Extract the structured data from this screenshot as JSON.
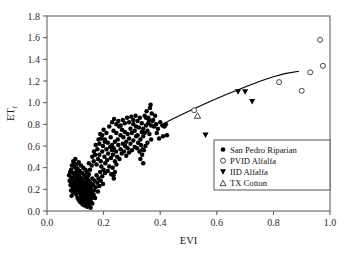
{
  "chart_data": {
    "type": "scatter",
    "title": "",
    "xlabel": "EVI",
    "ylabel": "ETf",
    "ylabel_base": "ET",
    "ylabel_sub": "f",
    "xlim": [
      0.0,
      1.0
    ],
    "ylim": [
      0.0,
      1.8
    ],
    "xticks": [
      "0.0",
      "0.2",
      "0.4",
      "0.6",
      "0.8",
      "1.0"
    ],
    "xtick_values": [
      0.0,
      0.2,
      0.4,
      0.6,
      0.8,
      1.0
    ],
    "yticks": [
      "0.0",
      "0.2",
      "0.4",
      "0.6",
      "0.8",
      "1.0",
      "1.2",
      "1.4",
      "1.6",
      "1.8"
    ],
    "ytick_values": [
      0.0,
      0.2,
      0.4,
      0.6,
      0.8,
      1.0,
      1.2,
      1.4,
      1.6,
      1.8
    ],
    "grid": false,
    "legend_position": "lower-right",
    "legend": [
      {
        "label": "San Pedro Riparian",
        "marker": "filled-circle"
      },
      {
        "label": "PVID Alfalfa",
        "marker": "open-circle"
      },
      {
        "label": "IID Alfalfa",
        "marker": "filled-triangle-down"
      },
      {
        "label": "TX Cotton",
        "marker": "open-triangle-up"
      }
    ],
    "series": [
      {
        "name": "San Pedro Riparian",
        "marker": "filled-circle",
        "points": [
          [
            0.085,
            0.38
          ],
          [
            0.088,
            0.42
          ],
          [
            0.09,
            0.3
          ],
          [
            0.092,
            0.35
          ],
          [
            0.094,
            0.25
          ],
          [
            0.095,
            0.44
          ],
          [
            0.096,
            0.2
          ],
          [
            0.098,
            0.33
          ],
          [
            0.099,
            0.28
          ],
          [
            0.1,
            0.4
          ],
          [
            0.101,
            0.18
          ],
          [
            0.102,
            0.24
          ],
          [
            0.103,
            0.36
          ],
          [
            0.104,
            0.15
          ],
          [
            0.105,
            0.31
          ],
          [
            0.106,
            0.22
          ],
          [
            0.107,
            0.27
          ],
          [
            0.108,
            0.12
          ],
          [
            0.109,
            0.34
          ],
          [
            0.11,
            0.19
          ],
          [
            0.111,
            0.26
          ],
          [
            0.112,
            0.29
          ],
          [
            0.113,
            0.1
          ],
          [
            0.114,
            0.23
          ],
          [
            0.115,
            0.32
          ],
          [
            0.116,
            0.17
          ],
          [
            0.117,
            0.21
          ],
          [
            0.118,
            0.08
          ],
          [
            0.119,
            0.25
          ],
          [
            0.12,
            0.14
          ],
          [
            0.121,
            0.3
          ],
          [
            0.122,
            0.11
          ],
          [
            0.123,
            0.2
          ],
          [
            0.124,
            0.27
          ],
          [
            0.125,
            0.16
          ],
          [
            0.126,
            0.06
          ],
          [
            0.127,
            0.23
          ],
          [
            0.128,
            0.13
          ],
          [
            0.129,
            0.28
          ],
          [
            0.13,
            0.09
          ],
          [
            0.131,
            0.18
          ],
          [
            0.132,
            0.24
          ],
          [
            0.133,
            0.05
          ],
          [
            0.134,
            0.15
          ],
          [
            0.135,
            0.21
          ],
          [
            0.136,
            0.31
          ],
          [
            0.137,
            0.11
          ],
          [
            0.138,
            0.26
          ],
          [
            0.139,
            0.07
          ],
          [
            0.14,
            0.17
          ],
          [
            0.141,
            0.22
          ],
          [
            0.142,
            0.04
          ],
          [
            0.143,
            0.13
          ],
          [
            0.144,
            0.29
          ],
          [
            0.145,
            0.19
          ],
          [
            0.146,
            0.09
          ],
          [
            0.147,
            0.24
          ],
          [
            0.148,
            0.14
          ],
          [
            0.149,
            0.06
          ],
          [
            0.15,
            0.2
          ],
          [
            0.151,
            0.27
          ],
          [
            0.152,
            0.11
          ],
          [
            0.153,
            0.16
          ],
          [
            0.154,
            0.03
          ],
          [
            0.155,
            0.22
          ],
          [
            0.156,
            0.08
          ],
          [
            0.157,
            0.18
          ],
          [
            0.158,
            0.25
          ],
          [
            0.159,
            0.12
          ],
          [
            0.16,
            0.3
          ],
          [
            0.093,
            0.46
          ],
          [
            0.097,
            0.41
          ],
          [
            0.1,
            0.48
          ],
          [
            0.104,
            0.43
          ],
          [
            0.108,
            0.39
          ],
          [
            0.112,
            0.45
          ],
          [
            0.116,
            0.37
          ],
          [
            0.12,
            0.42
          ],
          [
            0.124,
            0.35
          ],
          [
            0.128,
            0.4
          ],
          [
            0.132,
            0.33
          ],
          [
            0.136,
            0.38
          ],
          [
            0.14,
            0.36
          ],
          [
            0.144,
            0.32
          ],
          [
            0.148,
            0.34
          ],
          [
            0.082,
            0.36
          ],
          [
            0.086,
            0.31
          ],
          [
            0.089,
            0.26
          ],
          [
            0.091,
            0.22
          ],
          [
            0.093,
            0.17
          ],
          [
            0.078,
            0.33
          ],
          [
            0.08,
            0.28
          ],
          [
            0.083,
            0.24
          ],
          [
            0.085,
            0.19
          ],
          [
            0.087,
            0.14
          ],
          [
            0.145,
            0.05
          ],
          [
            0.15,
            0.09
          ],
          [
            0.155,
            0.13
          ],
          [
            0.16,
            0.07
          ],
          [
            0.165,
            0.15
          ],
          [
            0.163,
            0.24
          ],
          [
            0.166,
            0.19
          ],
          [
            0.168,
            0.28
          ],
          [
            0.17,
            0.12
          ],
          [
            0.172,
            0.22
          ],
          [
            0.175,
            0.33
          ],
          [
            0.178,
            0.26
          ],
          [
            0.18,
            0.18
          ],
          [
            0.182,
            0.3
          ],
          [
            0.185,
            0.23
          ],
          [
            0.188,
            0.36
          ],
          [
            0.19,
            0.28
          ],
          [
            0.192,
            0.41
          ],
          [
            0.195,
            0.32
          ],
          [
            0.198,
            0.25
          ],
          [
            0.175,
            0.43
          ],
          [
            0.18,
            0.48
          ],
          [
            0.185,
            0.52
          ],
          [
            0.19,
            0.46
          ],
          [
            0.195,
            0.55
          ],
          [
            0.2,
            0.38
          ],
          [
            0.203,
            0.5
          ],
          [
            0.206,
            0.44
          ],
          [
            0.21,
            0.57
          ],
          [
            0.213,
            0.47
          ],
          [
            0.216,
            0.53
          ],
          [
            0.22,
            0.41
          ],
          [
            0.223,
            0.59
          ],
          [
            0.226,
            0.49
          ],
          [
            0.23,
            0.56
          ],
          [
            0.195,
            0.7
          ],
          [
            0.2,
            0.75
          ],
          [
            0.205,
            0.66
          ],
          [
            0.21,
            0.72
          ],
          [
            0.215,
            0.63
          ],
          [
            0.22,
            0.78
          ],
          [
            0.225,
            0.68
          ],
          [
            0.23,
            0.61
          ],
          [
            0.235,
            0.74
          ],
          [
            0.24,
            0.64
          ],
          [
            0.233,
            0.52
          ],
          [
            0.236,
            0.58
          ],
          [
            0.24,
            0.46
          ],
          [
            0.244,
            0.55
          ],
          [
            0.248,
            0.5
          ],
          [
            0.252,
            0.61
          ],
          [
            0.256,
            0.48
          ],
          [
            0.26,
            0.57
          ],
          [
            0.264,
            0.53
          ],
          [
            0.268,
            0.62
          ],
          [
            0.228,
            0.34
          ],
          [
            0.232,
            0.4
          ],
          [
            0.236,
            0.3
          ],
          [
            0.24,
            0.36
          ],
          [
            0.245,
            0.43
          ],
          [
            0.245,
            0.72
          ],
          [
            0.25,
            0.66
          ],
          [
            0.255,
            0.78
          ],
          [
            0.26,
            0.7
          ],
          [
            0.265,
            0.75
          ],
          [
            0.27,
            0.68
          ],
          [
            0.275,
            0.73
          ],
          [
            0.28,
            0.64
          ],
          [
            0.285,
            0.71
          ],
          [
            0.29,
            0.67
          ],
          [
            0.272,
            0.55
          ],
          [
            0.276,
            0.6
          ],
          [
            0.28,
            0.51
          ],
          [
            0.285,
            0.58
          ],
          [
            0.29,
            0.54
          ],
          [
            0.295,
            0.62
          ],
          [
            0.3,
            0.56
          ],
          [
            0.305,
            0.65
          ],
          [
            0.31,
            0.59
          ],
          [
            0.315,
            0.69
          ],
          [
            0.295,
            0.76
          ],
          [
            0.3,
            0.72
          ],
          [
            0.305,
            0.8
          ],
          [
            0.31,
            0.74
          ],
          [
            0.315,
            0.78
          ],
          [
            0.32,
            0.7
          ],
          [
            0.325,
            0.77
          ],
          [
            0.33,
            0.66
          ],
          [
            0.335,
            0.73
          ],
          [
            0.34,
            0.69
          ],
          [
            0.318,
            0.58
          ],
          [
            0.322,
            0.63
          ],
          [
            0.327,
            0.55
          ],
          [
            0.332,
            0.61
          ],
          [
            0.338,
            0.57
          ],
          [
            0.23,
            0.82
          ],
          [
            0.237,
            0.85
          ],
          [
            0.245,
            0.8
          ],
          [
            0.252,
            0.83
          ],
          [
            0.26,
            0.79
          ],
          [
            0.268,
            0.84
          ],
          [
            0.275,
            0.81
          ],
          [
            0.283,
            0.86
          ],
          [
            0.29,
            0.82
          ],
          [
            0.298,
            0.87
          ],
          [
            0.305,
            0.84
          ],
          [
            0.313,
            0.88
          ],
          [
            0.32,
            0.83
          ],
          [
            0.328,
            0.86
          ],
          [
            0.335,
            0.81
          ],
          [
            0.34,
            0.76
          ],
          [
            0.345,
            0.72
          ],
          [
            0.35,
            0.79
          ],
          [
            0.355,
            0.74
          ],
          [
            0.36,
            0.84
          ],
          [
            0.345,
            0.88
          ],
          [
            0.352,
            0.92
          ],
          [
            0.358,
            0.86
          ],
          [
            0.364,
            0.95
          ],
          [
            0.37,
            0.9
          ],
          [
            0.366,
            0.98
          ],
          [
            0.372,
            0.83
          ],
          [
            0.378,
            0.78
          ],
          [
            0.362,
            0.71
          ],
          [
            0.368,
            0.66
          ],
          [
            0.355,
            0.63
          ],
          [
            0.348,
            0.6
          ],
          [
            0.342,
            0.56
          ],
          [
            0.336,
            0.52
          ],
          [
            0.33,
            0.48
          ],
          [
            0.34,
            0.44
          ],
          [
            0.228,
            0.34
          ],
          [
            0.235,
            0.33
          ],
          [
            0.215,
            0.37
          ],
          [
            0.205,
            0.35
          ],
          [
            0.385,
            0.8
          ],
          [
            0.392,
            0.76
          ],
          [
            0.4,
            0.82
          ],
          [
            0.408,
            0.79
          ],
          [
            0.415,
            0.78
          ],
          [
            0.42,
            0.8
          ],
          [
            0.424,
            0.7
          ],
          [
            0.41,
            0.69
          ],
          [
            0.396,
            0.67
          ],
          [
            0.388,
            0.72
          ],
          [
            0.375,
            0.84
          ],
          [
            0.382,
            0.88
          ],
          [
            0.368,
            0.79
          ],
          [
            0.358,
            0.81
          ],
          [
            0.35,
            0.86
          ],
          [
            0.165,
            0.46
          ],
          [
            0.17,
            0.52
          ],
          [
            0.158,
            0.42
          ],
          [
            0.152,
            0.38
          ],
          [
            0.148,
            0.44
          ],
          [
            0.185,
            0.62
          ],
          [
            0.178,
            0.57
          ],
          [
            0.172,
            0.61
          ],
          [
            0.166,
            0.55
          ],
          [
            0.16,
            0.5
          ],
          [
            0.192,
            0.67
          ],
          [
            0.198,
            0.6
          ],
          [
            0.204,
            0.64
          ],
          [
            0.188,
            0.71
          ],
          [
            0.182,
            0.66
          ]
        ]
      },
      {
        "name": "PVID Alfalfa",
        "marker": "open-circle",
        "points": [
          [
            0.52,
            0.93
          ],
          [
            0.82,
            1.19
          ],
          [
            0.9,
            1.11
          ],
          [
            0.93,
            1.28
          ],
          [
            0.965,
            1.58
          ],
          [
            0.975,
            1.34
          ]
        ]
      },
      {
        "name": "IID Alfalfa",
        "marker": "filled-triangle-down",
        "points": [
          [
            0.56,
            0.7
          ],
          [
            0.675,
            1.1
          ],
          [
            0.7,
            1.1
          ],
          [
            0.725,
            1.01
          ]
        ]
      },
      {
        "name": "TX Cotton",
        "marker": "open-triangle-up",
        "points": [
          [
            0.532,
            0.88
          ]
        ]
      }
    ],
    "fit_curve": {
      "name": "fitted trend",
      "x_start": 0.4,
      "x_end": 0.89,
      "points": [
        [
          0.4,
          0.79
        ],
        [
          0.44,
          0.845
        ],
        [
          0.48,
          0.895
        ],
        [
          0.52,
          0.945
        ],
        [
          0.56,
          0.992
        ],
        [
          0.6,
          1.038
        ],
        [
          0.64,
          1.082
        ],
        [
          0.68,
          1.124
        ],
        [
          0.72,
          1.165
        ],
        [
          0.76,
          1.204
        ],
        [
          0.8,
          1.24
        ],
        [
          0.84,
          1.268
        ],
        [
          0.89,
          1.29
        ]
      ]
    }
  }
}
